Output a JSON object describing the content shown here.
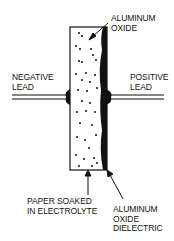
{
  "diagram": {
    "labels": {
      "aluminum_oxide": [
        "ALUMINUM",
        "OXIDE"
      ],
      "negative_lead": [
        "NEGATIVE",
        "LEAD"
      ],
      "positive_lead": [
        "POSITIVE",
        "LEAD"
      ],
      "paper": [
        "PAPER SOAKED",
        "IN ELECTROLYTE"
      ],
      "dielectric": [
        "ALUMINUM",
        "OXIDE",
        "DIELECTRIC"
      ]
    },
    "colors": {
      "line": "#111111",
      "background": "#ffffff"
    }
  }
}
